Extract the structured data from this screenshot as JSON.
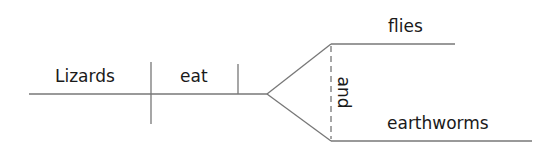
{
  "diagram": {
    "type": "sentence-diagram",
    "sentence": "Lizards eat flies and earthworms",
    "colors": {
      "line": "#777777",
      "text": "#1a1a1a",
      "background": "#ffffff"
    },
    "words": {
      "subject": "Lizards",
      "verb": "eat",
      "object_1": "flies",
      "conjunction": "and",
      "object_2": "earthworms"
    },
    "roles": {
      "subject": "Lizards",
      "predicate": "eat",
      "compound_direct_object": [
        "flies",
        "earthworms"
      ],
      "conjunction": "and"
    }
  }
}
